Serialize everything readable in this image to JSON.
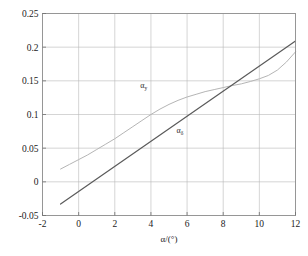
{
  "chart_data": {
    "type": "line",
    "title": "",
    "subtitle": "",
    "xlabel": "α/(°)",
    "ylabel": "",
    "xlim": [
      -2,
      12
    ],
    "ylim": [
      -0.05,
      0.25
    ],
    "xticks": [
      -2,
      0,
      2,
      4,
      6,
      8,
      10,
      12
    ],
    "xtick_labels": [
      "-2",
      "0",
      "2",
      "4",
      "6",
      "8",
      "10",
      "12"
    ],
    "yticks": [
      -0.05,
      0,
      0.05,
      0.1,
      0.15,
      0.2,
      0.25
    ],
    "ytick_labels": [
      "-0.05",
      "0",
      "0.05",
      "0.1",
      "0.15",
      "0.2",
      "0.25"
    ],
    "grid": true,
    "legend": "inline-annotations",
    "series": [
      {
        "name": "α_y",
        "label_base": "α",
        "label_sub": "y",
        "color": "#b5b5b5",
        "width": 1.0,
        "annotation": {
          "x": 3.6,
          "y": 0.139
        },
        "x": [
          -1.0,
          -0.5,
          0.0,
          0.5,
          1.0,
          1.5,
          2.0,
          2.5,
          3.0,
          3.5,
          4.0,
          4.5,
          5.0,
          5.5,
          6.0,
          6.5,
          7.0,
          7.5,
          8.0,
          8.5,
          9.0,
          9.5,
          10.0,
          10.5,
          11.0,
          11.5,
          12.0
        ],
        "y": [
          0.019,
          0.026,
          0.033,
          0.04,
          0.048,
          0.056,
          0.064,
          0.073,
          0.082,
          0.091,
          0.1,
          0.108,
          0.115,
          0.121,
          0.126,
          0.13,
          0.134,
          0.137,
          0.14,
          0.143,
          0.1455,
          0.149,
          0.153,
          0.158,
          0.166,
          0.178,
          0.193
        ]
      },
      {
        "name": "α_δ",
        "label_base": "α",
        "label_sub": "δ",
        "color": "#5a5a5a",
        "width": 1.2,
        "annotation": {
          "x": 5.6,
          "y": 0.073
        },
        "x": [
          -1.0,
          12.0
        ],
        "y": [
          -0.033,
          0.209
        ]
      }
    ],
    "notes": {
      "crossing_point": {
        "x": 8.7,
        "y": 0.143
      },
      "background_color": "#ffffff",
      "grid_color": "#b9b9b9",
      "frame_color": "#8c8c8c"
    }
  }
}
